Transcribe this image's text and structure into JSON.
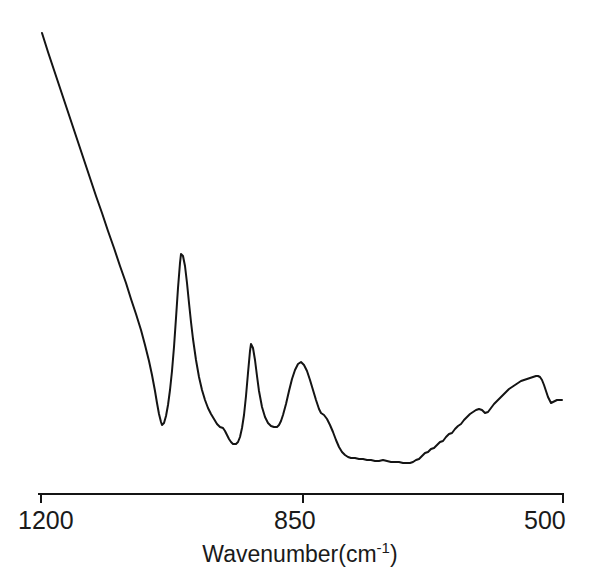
{
  "chart_data": {
    "type": "line",
    "title": "",
    "subtitle": "",
    "xlabel_text": "Wavenumber(cm",
    "xlabel_sup": "-1",
    "xlabel_close": ")",
    "xlabel_full": "Wavenumber(cm-1)",
    "ylabel": "",
    "xlim": [
      1200,
      500
    ],
    "x_axis_inverted": true,
    "ylim_note": "y axis not drawn; intensity in arbitrary units",
    "grid": false,
    "legend": null,
    "x_ticks": [
      {
        "value": 1200,
        "label": "1200",
        "px": 41
      },
      {
        "value": 850,
        "label": "850",
        "px": 303
      },
      {
        "value": 500,
        "label": "500",
        "px": 563
      }
    ],
    "axis_line": {
      "y_px": 494,
      "x_start_px": 38,
      "x_end_px": 564,
      "tick_length_px": 9
    },
    "line_color": "#141414",
    "line_width": 2.0,
    "annotations": [],
    "peaks": [
      {
        "name": "peak-1",
        "wavenumber": 1012,
        "px": 181,
        "py": 254,
        "relative_height": 1.0
      },
      {
        "name": "peak-2",
        "wavenumber": 918,
        "px": 251,
        "py": 344,
        "relative_height": 0.58
      },
      {
        "name": "peak-3",
        "wavenumber": 851,
        "px": 301,
        "py": 362,
        "relative_height": 0.48
      },
      {
        "name": "broad-band-max",
        "wavenumber": 533,
        "px": 538,
        "py": 376,
        "relative_height": 0.41
      }
    ],
    "valleys": [
      {
        "name": "valley-1",
        "wavenumber": 1038,
        "px": 162,
        "py": 425
      },
      {
        "name": "valley-2",
        "wavenumber": 939,
        "px": 236,
        "py": 444
      },
      {
        "name": "valley-3",
        "wavenumber": 882,
        "px": 278,
        "py": 427
      },
      {
        "name": "baseline-min",
        "wavenumber": 705,
        "px": 410,
        "py": 463
      }
    ],
    "series": [
      {
        "name": "spectrum",
        "points_px": [
          [
            42,
            33
          ],
          [
            48,
            52
          ],
          [
            54,
            70
          ],
          [
            60,
            88
          ],
          [
            66,
            106
          ],
          [
            72,
            124
          ],
          [
            78,
            142
          ],
          [
            84,
            160
          ],
          [
            90,
            178
          ],
          [
            96,
            196
          ],
          [
            102,
            213
          ],
          [
            108,
            231
          ],
          [
            114,
            248
          ],
          [
            120,
            266
          ],
          [
            126,
            283
          ],
          [
            131,
            299
          ],
          [
            136,
            314
          ],
          [
            141,
            330
          ],
          [
            145,
            345
          ],
          [
            149,
            361
          ],
          [
            152,
            375
          ],
          [
            155,
            391
          ],
          [
            157,
            403
          ],
          [
            159,
            414
          ],
          [
            161,
            422
          ],
          [
            162,
            425
          ],
          [
            164,
            423
          ],
          [
            166,
            416
          ],
          [
            168,
            405
          ],
          [
            170,
            390
          ],
          [
            172,
            371
          ],
          [
            174,
            347
          ],
          [
            176,
            318
          ],
          [
            178,
            288
          ],
          [
            180,
            263
          ],
          [
            181,
            254
          ],
          [
            183,
            256
          ],
          [
            185,
            266
          ],
          [
            187,
            283
          ],
          [
            189,
            303
          ],
          [
            191,
            322
          ],
          [
            193,
            339
          ],
          [
            196,
            360
          ],
          [
            199,
            377
          ],
          [
            202,
            390
          ],
          [
            205,
            400
          ],
          [
            208,
            408
          ],
          [
            211,
            414
          ],
          [
            214,
            419
          ],
          [
            217,
            424
          ],
          [
            220,
            427
          ],
          [
            223,
            428
          ],
          [
            225,
            431
          ],
          [
            227,
            435
          ],
          [
            229,
            439
          ],
          [
            231,
            442
          ],
          [
            233,
            444
          ],
          [
            236,
            444
          ],
          [
            238,
            442
          ],
          [
            240,
            437
          ],
          [
            242,
            428
          ],
          [
            244,
            415
          ],
          [
            246,
            396
          ],
          [
            248,
            373
          ],
          [
            250,
            351
          ],
          [
            251,
            344
          ],
          [
            253,
            348
          ],
          [
            255,
            360
          ],
          [
            257,
            376
          ],
          [
            259,
            391
          ],
          [
            262,
            407
          ],
          [
            265,
            417
          ],
          [
            268,
            423
          ],
          [
            271,
            426
          ],
          [
            274,
            427
          ],
          [
            277,
            427
          ],
          [
            279,
            425
          ],
          [
            281,
            421
          ],
          [
            283,
            415
          ],
          [
            286,
            404
          ],
          [
            289,
            391
          ],
          [
            292,
            379
          ],
          [
            295,
            370
          ],
          [
            298,
            364
          ],
          [
            301,
            362
          ],
          [
            304,
            365
          ],
          [
            307,
            371
          ],
          [
            310,
            380
          ],
          [
            313,
            390
          ],
          [
            316,
            400
          ],
          [
            319,
            409
          ],
          [
            321,
            413
          ],
          [
            324,
            415
          ],
          [
            327,
            419
          ],
          [
            330,
            425
          ],
          [
            333,
            432
          ],
          [
            336,
            440
          ],
          [
            339,
            447
          ],
          [
            342,
            452
          ],
          [
            345,
            455
          ],
          [
            348,
            457
          ],
          [
            351,
            458
          ],
          [
            355,
            458
          ],
          [
            359,
            459
          ],
          [
            363,
            459
          ],
          [
            367,
            460
          ],
          [
            371,
            460
          ],
          [
            375,
            461
          ],
          [
            379,
            461
          ],
          [
            383,
            460
          ],
          [
            387,
            461
          ],
          [
            391,
            462
          ],
          [
            395,
            462
          ],
          [
            399,
            462
          ],
          [
            403,
            463
          ],
          [
            407,
            463
          ],
          [
            410,
            463
          ],
          [
            413,
            462
          ],
          [
            416,
            460
          ],
          [
            419,
            459
          ],
          [
            422,
            456
          ],
          [
            425,
            453
          ],
          [
            428,
            452
          ],
          [
            431,
            449
          ],
          [
            434,
            448
          ],
          [
            437,
            445
          ],
          [
            440,
            442
          ],
          [
            443,
            441
          ],
          [
            446,
            437
          ],
          [
            449,
            434
          ],
          [
            452,
            433
          ],
          [
            455,
            429
          ],
          [
            458,
            426
          ],
          [
            461,
            424
          ],
          [
            464,
            420
          ],
          [
            467,
            417
          ],
          [
            470,
            414
          ],
          [
            473,
            412
          ],
          [
            476,
            410
          ],
          [
            479,
            409
          ],
          [
            482,
            410
          ],
          [
            485,
            413
          ],
          [
            488,
            412
          ],
          [
            491,
            408
          ],
          [
            494,
            404
          ],
          [
            497,
            401
          ],
          [
            500,
            398
          ],
          [
            503,
            395
          ],
          [
            506,
            392
          ],
          [
            509,
            389
          ],
          [
            512,
            387
          ],
          [
            515,
            385
          ],
          [
            518,
            383
          ],
          [
            521,
            381
          ],
          [
            524,
            380
          ],
          [
            527,
            379
          ],
          [
            530,
            378
          ],
          [
            533,
            377
          ],
          [
            536,
            376
          ],
          [
            538,
            376
          ],
          [
            540,
            377
          ],
          [
            542,
            380
          ],
          [
            544,
            385
          ],
          [
            546,
            391
          ],
          [
            548,
            397
          ],
          [
            550,
            401
          ],
          [
            551,
            403
          ],
          [
            553,
            402
          ],
          [
            555,
            401
          ],
          [
            557,
            400
          ],
          [
            560,
            400
          ],
          [
            562,
            400
          ]
        ]
      }
    ]
  }
}
